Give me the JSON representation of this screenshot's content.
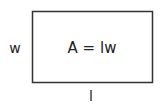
{
  "diagram": {
    "type": "rectangle-area",
    "formula": "A = lw",
    "width_label": "w",
    "length_label": "l",
    "stroke_color": "#333333",
    "text_color": "#222222"
  }
}
